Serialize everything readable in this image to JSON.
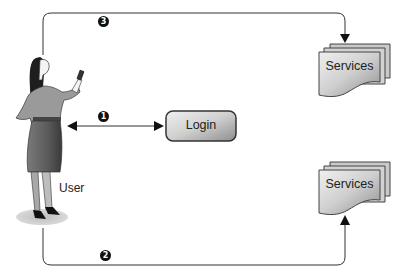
{
  "diagram": {
    "actor": {
      "label": "User",
      "icon": "woman-with-phone-figure"
    },
    "login": {
      "label": "Login"
    },
    "services_top": {
      "label": "Services"
    },
    "services_bottom": {
      "label": "Services"
    },
    "steps": [
      {
        "number": "1",
        "description": "User ↔ Login (bidirectional)"
      },
      {
        "number": "2",
        "description": "User → Services (bottom)"
      },
      {
        "number": "3",
        "description": "User → Services (top)"
      }
    ],
    "colors": {
      "line": "#333333",
      "box_fill_light": "#e6e6e6",
      "box_fill_dark": "#9a9a9a",
      "badge": "#111111"
    }
  }
}
